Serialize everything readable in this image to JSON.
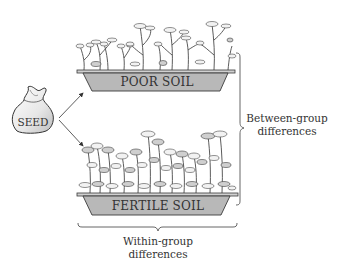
{
  "diagram": {
    "seed": {
      "label": "SEED",
      "icon": "seed-bag-icon"
    },
    "trays": [
      {
        "id": "poor",
        "label": "POOR SOIL",
        "plant_density": "sparse"
      },
      {
        "id": "fertile",
        "label": "FERTILE SOIL",
        "plant_density": "lush"
      }
    ],
    "braces": {
      "between": {
        "line1": "Between-group",
        "line2": "differences"
      },
      "within": {
        "line1": "Within-group",
        "line2": "differences"
      }
    },
    "colors": {
      "tray_fill": "#b8b8b8",
      "tray_stroke": "#3a3a3a",
      "text": "#333333",
      "background": "#ffffff"
    }
  }
}
